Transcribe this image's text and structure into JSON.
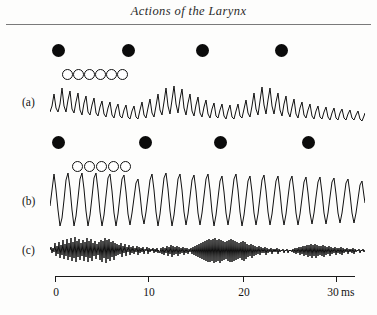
{
  "header": {
    "running_head": "Actions of the Larynx"
  },
  "figure": {
    "traces": [
      {
        "id": "a",
        "label": "(a)",
        "label_x": 22,
        "label_y": 66,
        "filled_markers": {
          "y": 14,
          "diameter": 13,
          "x_positions": [
            52,
            122,
            196,
            275
          ]
        },
        "open_markers": {
          "y": 39,
          "diameter": 11,
          "x_positions": [
            62,
            73,
            84,
            95,
            106,
            117
          ]
        },
        "wave": {
          "x": 50,
          "y": 52,
          "width": 315,
          "height": 48,
          "baseline": 30,
          "description": "irregular decaying oscillation",
          "points": "0,30 2,24 4,12 6,26 8,30 10,22 12,6 14,24 16,30 18,18 20,9 22,27 24,31 26,20 28,11 30,28 32,33 34,21 36,14 38,30 40,33 42,23 44,16 46,31 48,34 50,25 52,19 54,32 56,35 58,26 60,20 62,33 64,36 66,27 68,22 70,34 72,36 74,28 76,23 78,35 80,37 82,29 84,24 86,35 88,37 90,28 92,20 94,33 96,36 98,26 100,17 102,31 104,35 106,24 108,12 110,28 112,33 114,20 116,6 118,24 120,32 122,18 124,4 126,22 128,31 130,17 132,7 134,26 136,33 138,21 140,12 142,29 144,34 146,23 148,15 150,31 152,35 154,25 156,18 158,32 160,36 162,27 164,21 166,34 168,36 170,28 172,22 174,34 176,37 178,29 180,23 182,35 184,37 186,29 188,22 190,34 192,36 194,27 196,18 198,31 200,35 202,24 204,11 206,27 208,33 210,19 212,5 214,23 216,32 218,18 220,6 222,24 224,32 226,20 228,11 230,28 232,34 234,22 236,14 238,30 240,35 242,25 244,17 246,32 248,36 250,26 252,20 254,33 256,36 258,28 260,22 262,34 264,37 266,29 268,24 270,35 272,37 274,30 276,25 278,35 280,38 282,31 284,26 286,36 288,38 290,31 292,27 294,36 296,38 298,32 300,28 302,36 304,38 306,33 308,29 310,37 312,39 314,34 315,31"
        }
      },
      {
        "id": "b",
        "label": "(b)",
        "label_x": 22,
        "label_y": 165,
        "filled_markers": {
          "y": 106,
          "diameter": 13,
          "x_positions": [
            52,
            139,
            214,
            302
          ]
        },
        "open_markers": {
          "y": 131,
          "diameter": 11,
          "x_positions": [
            72,
            84,
            96,
            108,
            120
          ]
        },
        "wave": {
          "x": 50,
          "y": 140,
          "width": 315,
          "height": 62,
          "baseline": 36,
          "description": "large regular quasi-sinusoidal oscillation",
          "points": "0,36 2,20 4,4 6,20 8,40 10,56 12,48 14,30 16,10 18,3 20,18 22,40 24,56 26,46 28,28 30,9 32,3 34,19 36,41 38,56 40,45 42,27 44,8 46,3 48,20 50,42 52,56 54,45 56,26 58,8 60,4 62,21 64,43 66,56 68,44 70,26 72,9 74,5 76,22 78,44 80,55 82,43 84,28 86,13 88,9 90,24 92,44 94,54 96,42 98,26 100,10 102,4 104,20 106,42 108,56 110,44 112,26 114,8 116,3 118,19 120,41 122,56 124,45 126,27 128,9 130,4 132,20 134,42 136,55 138,44 140,27 142,10 144,5 146,21 148,43 150,55 152,43 154,26 156,9 158,4 160,20 162,42 164,56 166,45 168,28 170,11 172,6 174,22 176,43 178,55 180,43 182,26 184,9 186,4 188,20 190,42 192,56 194,45 196,28 198,11 200,6 202,22 204,43 206,55 208,44 210,27 212,10 214,5 216,21 218,42 220,55 222,44 224,27 226,11 228,6 230,22 232,43 234,55 236,44 238,27 240,11 242,6 244,22 246,43 248,55 250,44 252,28 254,12 256,7 258,23 260,43 262,54 264,43 266,27 268,12 270,7 272,23 274,43 276,54 278,43 280,27 282,12 284,8 286,24 288,43 290,53 292,43 294,28 296,13 298,9 300,24 302,43 304,53 306,43 308,29 310,15 312,11 314,26 315,33"
        }
      },
      {
        "id": "c",
        "label": "(c)",
        "label_x": 22,
        "label_y": 214,
        "wave": {
          "x": 50,
          "y": 198,
          "width": 315,
          "height": 38,
          "baseline": 22,
          "description": "low amplitude high frequency noisy trace with a mid burst",
          "points": "0,22 1,19 2,25 3,20 4,24 5,15 6,28 7,18 8,26 9,14 10,30 11,17 12,27 13,12 14,31 15,16 16,28 17,11 18,32 19,15 20,29 21,10 22,33 23,14 24,30 25,9 26,34 27,13 28,29 29,11 30,32 31,15 32,28 33,12 34,33 35,14 36,29 37,10 38,34 39,13 40,30 41,11 42,33 43,15 44,28 45,13 46,31 47,16 48,27 49,14 50,32 51,12 52,34 53,13 54,30 55,10 56,35 57,12 58,31 59,11 60,33 61,14 62,29 63,13 64,32 65,15 66,28 67,16 68,27 69,17 70,26 71,15 72,29 73,18 74,25 75,16 76,28 77,19 78,24 79,17 80,27 81,19 82,25 83,18 84,26 85,20 86,24 87,18 88,27 89,19 90,25 91,20 92,24 93,19 94,26 95,21 96,23 97,19 98,26 99,20 100,24 101,21 102,23 103,20 104,25 105,21 106,24 107,20 108,25 108.5,22 109,23 110,25 111,20 112,26 113,19 114,27 115,20 116,25 117,18 118,28 119,19 120,26 121,17 122,29 123,18 124,27 125,19 126,26 127,18 128,28 129,19 130,26 131,20 132,25 133,19 134,27 135,20 136,25 137,20 138,26 139,21 140,24 141,20 142,26 143,19 144,27 145,18 146,28 147,17 148,29 149,16 150,30 151,15 152,31 153,14 154,32 155,13 156,33 157,12 158,34 159,11 160,34 161,12 162,33 163,11 164,35 165,10 166,34 167,12 168,33 169,11 170,35 171,12 172,33 173,13 174,32 175,14 176,31 177,13 178,33 179,12 180,34 181,11 182,34 183,12 184,33 185,13 186,32 187,14 188,31 189,15 190,30 191,14 192,32 193,13 194,33 195,14 196,31 197,16 198,29 199,17 200,28 201,16 202,30 203,17 204,28 205,18 206,27 207,19 208,26 209,18 210,27 211,19 212,25 213,20 214,25 215,19 216,27 217,20 218,25 219,21 220,24 221,20 222,26 223,21 224,24 225,21 226,24 227,20 228,26 229,21 230,24 231,22 232,23 233,21 234,25 235,22 236,23 237,21 238,25 239,22 240,23 241,22 242,24 243,21 244,25 245,20 246,26 247,20 248,25 249,19 250,27 251,19 252,26 253,18 254,28 255,18 256,27 257,17 258,29 259,17 260,28 261,16 262,30 263,17 264,28 265,16 266,30 267,17 268,28 269,18 270,27 271,18 272,28 273,17 274,29 275,18 276,27 277,19 278,26 279,18 280,28 281,19 282,26 283,20 284,25 285,19 286,27 287,20 288,25 289,20 290,26 291,19 292,27 293,20 294,25 295,21 296,24 297,20 298,26 299,21 300,24 301,21 302,25 303,20 304,26 305,21 306,24 307,22 308,23 309,21 310,25 311,22 312,23 313,21 314,24 315,22"
        }
      }
    ],
    "axis": {
      "x": 55,
      "y": 276,
      "width": 300,
      "unit": "ms",
      "ticks": [
        {
          "value": "0",
          "x": 55
        },
        {
          "value": "10",
          "x": 148
        },
        {
          "value": "20",
          "x": 243
        },
        {
          "value": "30",
          "x": 336
        }
      ],
      "label_y": 286
    },
    "legend_note": {
      "filled_marker": "filled-circle-marker",
      "open_marker": "open-circle-marker"
    }
  },
  "colors": {
    "ink": "#111111",
    "page": "#fdfdfc",
    "rule": "#7a7a7a"
  }
}
